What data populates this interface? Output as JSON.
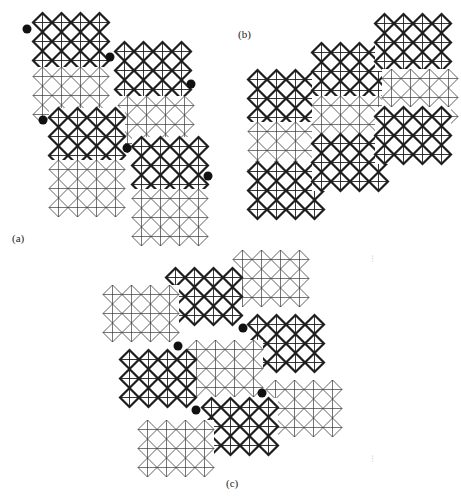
{
  "figure": {
    "colors": {
      "bold": "#1e1e1e",
      "light": "#3a3a3a",
      "dot": "#111111",
      "background": "#ffffff"
    },
    "cell": 19,
    "panels": [
      {
        "id": "a",
        "label": "(a)",
        "label_pos": [
          12,
          232
        ],
        "blocks": [
          {
            "style": "bold",
            "x": 33,
            "y": 13,
            "cols": 4,
            "rows": 3
          },
          {
            "style": "light",
            "x": 33,
            "y": 67,
            "cols": 4,
            "rows": 3
          },
          {
            "style": "bold",
            "x": 115,
            "y": 42,
            "cols": 4,
            "rows": 3
          },
          {
            "style": "light",
            "x": 118,
            "y": 96,
            "cols": 4,
            "rows": 3
          },
          {
            "style": "bold",
            "x": 49,
            "y": 108,
            "cols": 4,
            "rows": 3
          },
          {
            "style": "light",
            "x": 49,
            "y": 160,
            "cols": 4,
            "rows": 3
          },
          {
            "style": "bold",
            "x": 132,
            "y": 137,
            "cols": 4,
            "rows": 3
          },
          {
            "style": "light",
            "x": 132,
            "y": 189,
            "cols": 4,
            "rows": 3
          }
        ],
        "dots": [
          [
            27,
            29
          ],
          [
            110,
            57
          ],
          [
            191,
            84
          ],
          [
            43,
            120
          ],
          [
            127,
            148
          ],
          [
            208,
            176
          ]
        ]
      },
      {
        "id": "b",
        "label": "(b)",
        "label_pos": [
          238,
          28
        ],
        "blocks": [
          {
            "style": "bold",
            "x": 248,
            "y": 70,
            "cols": 4,
            "rows": 3
          },
          {
            "style": "light",
            "x": 248,
            "y": 122,
            "cols": 4,
            "rows": 3
          },
          {
            "style": "bold",
            "x": 248,
            "y": 162,
            "cols": 4,
            "rows": 3
          },
          {
            "style": "bold",
            "x": 312,
            "y": 43,
            "cols": 4,
            "rows": 3
          },
          {
            "style": "light",
            "x": 312,
            "y": 96,
            "cols": 4,
            "rows": 3
          },
          {
            "style": "bold",
            "x": 312,
            "y": 134,
            "cols": 4,
            "rows": 3
          },
          {
            "style": "bold",
            "x": 375,
            "y": 14,
            "cols": 4,
            "rows": 3
          },
          {
            "style": "light",
            "x": 382,
            "y": 69,
            "cols": 4,
            "rows": 3
          },
          {
            "style": "bold",
            "x": 375,
            "y": 107,
            "cols": 4,
            "rows": 3
          }
        ],
        "dots": []
      },
      {
        "id": "c",
        "label": "(c)",
        "label_pos": [
          226,
          477
        ],
        "blocks": [
          {
            "style": "light",
            "x": 233,
            "y": 250,
            "cols": 4,
            "rows": 3
          },
          {
            "style": "bold",
            "x": 166,
            "y": 268,
            "cols": 4,
            "rows": 3
          },
          {
            "style": "light",
            "x": 103,
            "y": 285,
            "cols": 4,
            "rows": 3
          },
          {
            "style": "bold",
            "x": 248,
            "y": 315,
            "cols": 4,
            "rows": 3
          },
          {
            "style": "light",
            "x": 187,
            "y": 340,
            "cols": 4,
            "rows": 3
          },
          {
            "style": "bold",
            "x": 120,
            "y": 350,
            "cols": 4,
            "rows": 3
          },
          {
            "style": "light",
            "x": 266,
            "y": 380,
            "cols": 4,
            "rows": 3
          },
          {
            "style": "bold",
            "x": 202,
            "y": 398,
            "cols": 4,
            "rows": 3
          },
          {
            "style": "light",
            "x": 138,
            "y": 420,
            "cols": 4,
            "rows": 3
          }
        ],
        "dots": [
          [
            178,
            346
          ],
          [
            243,
            328
          ],
          [
            262,
            393
          ],
          [
            196,
            410
          ]
        ]
      }
    ],
    "artifacts": [
      {
        "x": 371,
        "y": 262,
        "text": "⁝"
      },
      {
        "x": 371,
        "y": 462,
        "text": "⁝"
      }
    ]
  }
}
